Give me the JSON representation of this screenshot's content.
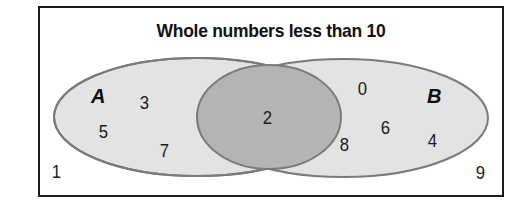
{
  "diagram": {
    "title": "Whole numbers less than 10",
    "universe": "Whole numbers less than 10",
    "sets": [
      {
        "name": "A",
        "only_elements": [
          "3",
          "5",
          "7"
        ]
      },
      {
        "name": "B",
        "only_elements": [
          "0",
          "6",
          "8",
          "4"
        ]
      }
    ],
    "intersection": {
      "sets": [
        "A",
        "B"
      ],
      "elements": [
        "2"
      ]
    },
    "outside": [
      "1",
      "9"
    ],
    "labels": {
      "set_a": "A",
      "set_b": "B",
      "n3": "3",
      "n5": "5",
      "n7": "7",
      "n2": "2",
      "n0": "0",
      "n6": "6",
      "n8": "8",
      "n4": "4",
      "n1": "1",
      "n9": "9"
    },
    "colors": {
      "set_fill": "#e3e3e3",
      "intersection_fill": "#b4b4b4",
      "outline": "#7a7a7a",
      "frame": "#1a1a1a",
      "background": "#ffffff"
    }
  }
}
